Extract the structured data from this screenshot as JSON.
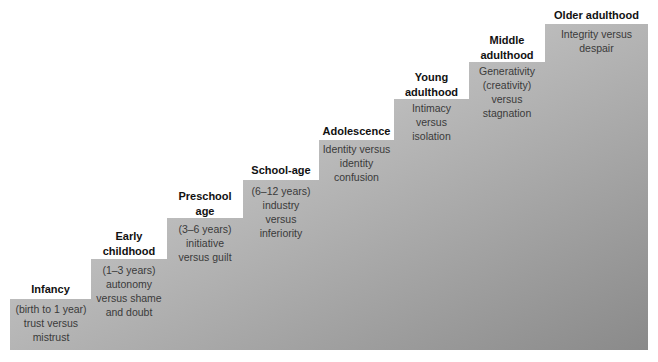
{
  "diagram": {
    "type": "staircase",
    "gradient": {
      "light": "#dcdcdc",
      "mid": "#b8b8b8",
      "dark": "#8c8c8c"
    },
    "stages": [
      {
        "title": "Infancy",
        "description": "(birth to 1 year)\ntrust versus\nmistrust"
      },
      {
        "title": "Early\nchildhood",
        "description": "(1–3 years)\nautonomy\nversus shame\nand doubt"
      },
      {
        "title": "Preschool\nage",
        "description": "(3–6 years)\ninitiative\nversus guilt"
      },
      {
        "title": "School-age",
        "description": "(6–12 years)\nindustry\nversus\ninferiority"
      },
      {
        "title": "Adolescence",
        "description": "Identity versus\nidentity\nconfusion"
      },
      {
        "title": "Young\nadulthood",
        "description": "Intimacy\nversus\nisolation"
      },
      {
        "title": "Middle\nadulthood",
        "description": "Generativity\n(creativity)\nversus\nstagnation"
      },
      {
        "title": "Older adulthood",
        "description": "Integrity versus\ndespair"
      }
    ]
  }
}
